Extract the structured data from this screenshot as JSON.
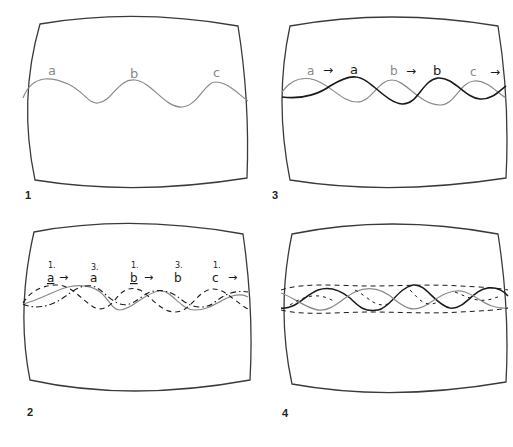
{
  "figure": {
    "colors": {
      "outline": "#3a3a3a",
      "gray_wave": "#8a8a8a",
      "black_wave": "#1a1a1a",
      "label_gray": "#888888",
      "label_black": "#1a1a1a"
    }
  },
  "panels": [
    {
      "number": "1",
      "labels": [
        {
          "text": "a",
          "tone": "gray"
        },
        {
          "text": "b",
          "tone": "gray"
        },
        {
          "text": "c",
          "tone": "gray"
        }
      ],
      "waves": [
        "gray-solid"
      ]
    },
    {
      "number": "3",
      "labels": [
        {
          "text": "a",
          "tone": "gray"
        },
        {
          "text": "→",
          "tone": "black"
        },
        {
          "text": "a",
          "tone": "black"
        },
        {
          "text": "b",
          "tone": "gray"
        },
        {
          "text": "→",
          "tone": "black"
        },
        {
          "text": "b",
          "tone": "black"
        },
        {
          "text": "c",
          "tone": "gray"
        },
        {
          "text": "→",
          "tone": "black"
        }
      ],
      "waves": [
        "gray-solid",
        "black-solid"
      ]
    },
    {
      "number": "2",
      "labels": [
        {
          "index": "1.",
          "text": "a",
          "arrow": "→"
        },
        {
          "index": "3.",
          "text": "a"
        },
        {
          "index": "1.",
          "text": "b",
          "arrow": "→"
        },
        {
          "index": "3.",
          "text": "b"
        },
        {
          "index": "1.",
          "text": "c",
          "arrow": "→"
        }
      ],
      "waves": [
        "gray-solid",
        "black-dashed",
        "black-dash-dot"
      ]
    },
    {
      "number": "4",
      "labels": [],
      "waves": [
        "black-solid",
        "gray-solid",
        "black-dashed",
        "black-dash-dot"
      ]
    }
  ]
}
